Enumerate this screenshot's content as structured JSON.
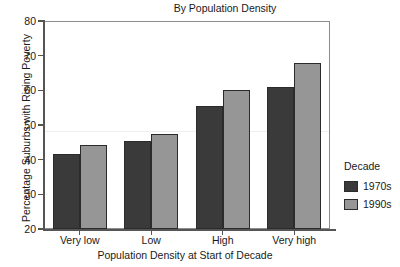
{
  "chart_data": {
    "type": "bar",
    "title": "By Population Density",
    "xlabel": "Population Density at Start of Decade",
    "ylabel": "Percentage Suburbs with Rising Poverty",
    "categories": [
      "Very low",
      "Low",
      "High",
      "Very high"
    ],
    "series": [
      {
        "name": "1970s",
        "color": "#3a3a3a",
        "values": [
          41.5,
          45.5,
          55.5,
          61.0
        ]
      },
      {
        "name": "1990s",
        "color": "#969696",
        "values": [
          44.3,
          47.3,
          60.0,
          68.0
        ]
      }
    ],
    "ylim": [
      20,
      80
    ],
    "yticks": [
      20,
      30,
      40,
      50,
      60,
      70,
      80
    ],
    "ytick_labels": [
      "20",
      "30",
      "40",
      "50",
      "60",
      "70",
      "80"
    ],
    "grid": false,
    "legend": {
      "title": "Decade",
      "position": "right",
      "entries": [
        "1970s",
        "1990s"
      ]
    }
  },
  "legend": {
    "title": "Decade",
    "items": [
      {
        "label": "1970s",
        "color": "#3a3a3a"
      },
      {
        "label": "1990s",
        "color": "#969696"
      }
    ]
  },
  "axes": {
    "y_tick_labels": [
      "80",
      "70",
      "60",
      "50",
      "40",
      "30",
      "20"
    ],
    "x_category_labels": [
      "Very low",
      "Low",
      "High",
      "Very high"
    ]
  }
}
